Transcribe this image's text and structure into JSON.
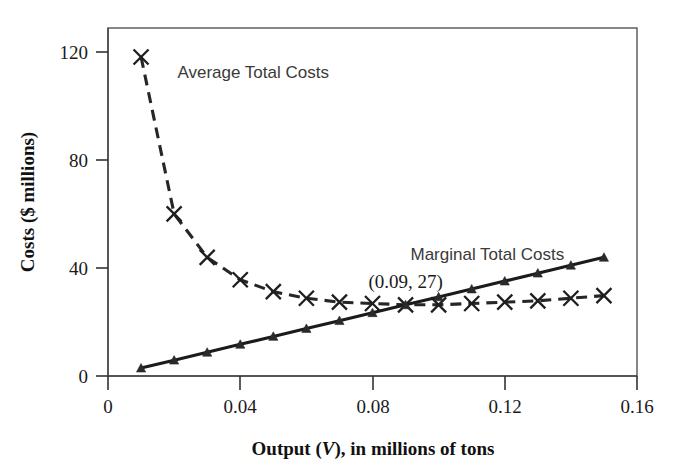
{
  "chart_data": {
    "type": "line",
    "title": "",
    "xlabel": "Output (V), in millions of tons",
    "xlabel_parts": {
      "pre": "Output (",
      "italic": "V",
      "post": "), in millions of tons"
    },
    "ylabel": "Costs ($ millions)",
    "xlim": [
      0,
      0.16
    ],
    "ylim": [
      0,
      132
    ],
    "xticks": [
      "0",
      "0.04",
      "0.08",
      "0.12",
      "0.16"
    ],
    "xtick_values": [
      0,
      0.04,
      0.08,
      0.12,
      0.16
    ],
    "yticks": [
      "0",
      "40",
      "80",
      "120"
    ],
    "ytick_values": [
      0,
      40,
      80,
      120
    ],
    "grid": false,
    "legend_position": "inline-annotation",
    "annotations": [
      {
        "text": "(0.09, 27)",
        "x": 0.09,
        "y": 27
      }
    ],
    "series": [
      {
        "name": "Average Total Costs",
        "marker": "x",
        "linestyle": "dashed",
        "color": "#262626",
        "label_x": 0.021,
        "label_y": 113,
        "x": [
          0.01,
          0.02,
          0.03,
          0.04,
          0.05,
          0.06,
          0.07,
          0.08,
          0.09,
          0.1,
          0.11,
          0.12,
          0.13,
          0.14,
          0.15
        ],
        "values": [
          121,
          61.5,
          45,
          36.5,
          32,
          29.5,
          28,
          27.5,
          27,
          27,
          27.5,
          28,
          28.5,
          29.5,
          30.5
        ]
      },
      {
        "name": "Marginal Total Costs",
        "marker": "triangle",
        "linestyle": "solid",
        "color": "#1b1b1b",
        "label_x": 0.0915,
        "label_y": 44,
        "x": [
          0.01,
          0.02,
          0.03,
          0.04,
          0.05,
          0.06,
          0.07,
          0.08,
          0.09,
          0.1,
          0.11,
          0.12,
          0.13,
          0.14,
          0.15
        ],
        "values": [
          3,
          6,
          9,
          12,
          15,
          18,
          21,
          24,
          27,
          30,
          33,
          36,
          39,
          42,
          45
        ]
      }
    ]
  },
  "colors": {
    "background": "#ffffff",
    "axis": "#444444",
    "frame": "#555555",
    "text": "#1a1a1a",
    "series_label": "#3a3a3a"
  }
}
